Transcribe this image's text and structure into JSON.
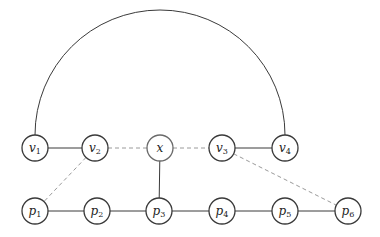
{
  "diagram": {
    "node_radius": 13,
    "nodes": [
      {
        "id": "v1",
        "base": "v",
        "sub": "1",
        "x": 35,
        "y": 148
      },
      {
        "id": "v2",
        "base": "v",
        "sub": "2",
        "x": 95,
        "y": 148
      },
      {
        "id": "x",
        "base": "x",
        "sub": "",
        "x": 160,
        "y": 148
      },
      {
        "id": "v3",
        "base": "v",
        "sub": "3",
        "x": 222,
        "y": 148
      },
      {
        "id": "v4",
        "base": "v",
        "sub": "4",
        "x": 285,
        "y": 148
      },
      {
        "id": "p1",
        "base": "p",
        "sub": "1",
        "x": 35,
        "y": 211
      },
      {
        "id": "p2",
        "base": "p",
        "sub": "2",
        "x": 97,
        "y": 211
      },
      {
        "id": "p3",
        "base": "p",
        "sub": "3",
        "x": 159,
        "y": 211
      },
      {
        "id": "p4",
        "base": "p",
        "sub": "4",
        "x": 222,
        "y": 211
      },
      {
        "id": "p5",
        "base": "p",
        "sub": "5",
        "x": 285,
        "y": 211
      },
      {
        "id": "p6",
        "base": "p",
        "sub": "6",
        "x": 348,
        "y": 211
      }
    ],
    "edges": [
      {
        "from": "v1",
        "to": "v2",
        "style": "solid"
      },
      {
        "from": "v3",
        "to": "v4",
        "style": "solid"
      },
      {
        "from": "x",
        "to": "p3",
        "style": "solid"
      },
      {
        "from": "p1",
        "to": "p2",
        "style": "solid"
      },
      {
        "from": "p2",
        "to": "p3",
        "style": "solid"
      },
      {
        "from": "p3",
        "to": "p4",
        "style": "solid"
      },
      {
        "from": "p4",
        "to": "p5",
        "style": "solid"
      },
      {
        "from": "p5",
        "to": "p6",
        "style": "solid"
      },
      {
        "from": "v2",
        "to": "x",
        "style": "dashed"
      },
      {
        "from": "x",
        "to": "v3",
        "style": "dashed"
      },
      {
        "from": "v2",
        "to": "p1",
        "style": "dashed"
      },
      {
        "from": "v3",
        "to": "p6",
        "style": "dashed"
      }
    ],
    "arcs": [
      {
        "from": "v1",
        "to": "v4",
        "style": "solid",
        "shape": "semicircle-above"
      }
    ],
    "colors": {
      "stroke": "#3a3a3a",
      "dashed": "#9a9a9a",
      "background": "#ffffff"
    }
  }
}
